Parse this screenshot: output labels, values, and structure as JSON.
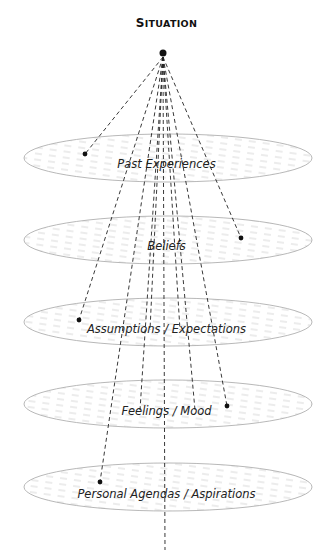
{
  "title": {
    "first_letter": "S",
    "rest": "ITUATION"
  },
  "source_point": {
    "x": 163,
    "y": 53
  },
  "layers": [
    {
      "label": "Past Experiences",
      "cy": 158,
      "label_y": 166,
      "dot": {
        "x": 85,
        "y": 154
      }
    },
    {
      "label": "Beliefs",
      "cy": 240,
      "label_y": 248,
      "dot": {
        "x": 241,
        "y": 238
      }
    },
    {
      "label": "Assumptions / Expectations",
      "cy": 322,
      "label_y": 331,
      "dot": {
        "x": 79,
        "y": 320
      }
    },
    {
      "label": "Feelings / Mood",
      "cy": 404,
      "label_y": 413,
      "dot": {
        "x": 227,
        "y": 406
      }
    },
    {
      "label": "Personal Agendas / Aspirations",
      "cy": 487,
      "label_y": 496,
      "dot": {
        "x": 100,
        "y": 482
      }
    }
  ],
  "colors": {
    "ellipse_stroke": "#b0b0b0",
    "hatch": "#c8c8c8",
    "dash_line": "#222222",
    "dot": "#111111"
  }
}
